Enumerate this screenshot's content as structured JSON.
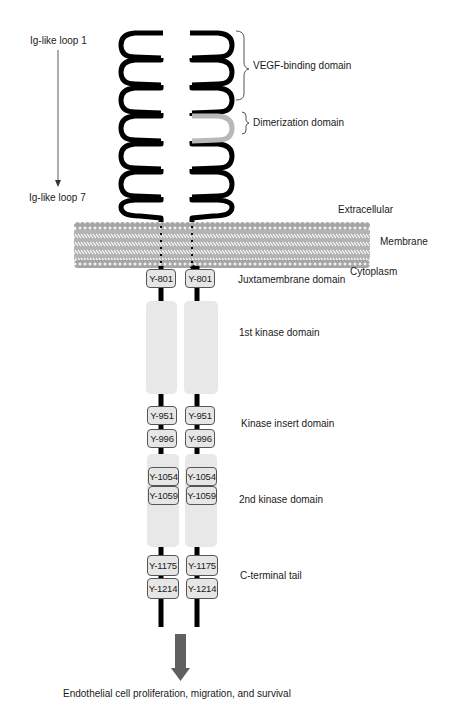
{
  "left_labels": {
    "loop_top": "Ig-like loop 1",
    "loop_bottom": "Ig-like loop 7"
  },
  "right_labels": {
    "vegf_binding": "VEGF-binding domain",
    "dimerization": "Dimerization domain",
    "extracellular": "Extracellular",
    "membrane": "Membrane",
    "cytoplasm": "Cytoplasm",
    "juxtamembrane": "Juxtamembrane domain",
    "kinase1": "1st kinase domain",
    "kinase_insert": "Kinase insert domain",
    "kinase2": "2nd kinase domain",
    "c_terminal": "C-terminal tail"
  },
  "tyrosines": {
    "y801": "Y-801",
    "y951": "Y-951",
    "y996": "Y-996",
    "y1054": "Y-1054",
    "y1059": "Y-1059",
    "y1175": "Y-1175",
    "y1214": "Y-1214"
  },
  "outcome": "Endothelial cell proliferation, migration, and survival",
  "colors": {
    "chain": "#000000",
    "dimerization_loop": "#b8b8b8",
    "membrane": "#a8a8a8",
    "kinase_block": "#e8e8e8",
    "arrow": "#606060"
  }
}
